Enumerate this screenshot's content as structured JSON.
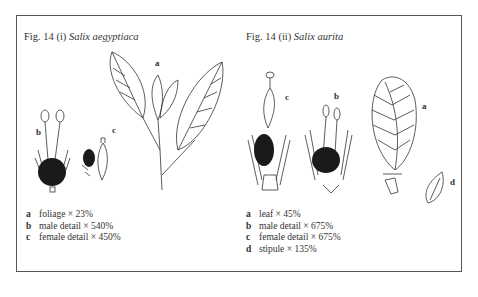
{
  "figures": [
    {
      "title_prefix": "Fig. 14 (i)",
      "species": "Salix aegyptiaca",
      "legend": [
        {
          "key": "a",
          "text": "foliage  × 23%"
        },
        {
          "key": "b",
          "text": "male detail  × 540%"
        },
        {
          "key": "c",
          "text": "female detail  × 450%"
        }
      ],
      "drawing_labels": {
        "a": "a",
        "b": "b",
        "c": "c"
      }
    },
    {
      "title_prefix": "Fig. 14 (ii)",
      "species": "Salix aurita",
      "legend": [
        {
          "key": "a",
          "text": "leaf  × 45%"
        },
        {
          "key": "b",
          "text": "male detail  × 675%"
        },
        {
          "key": "c",
          "text": "female detail  × 675%"
        },
        {
          "key": "d",
          "text": "stipule  × 135%"
        }
      ],
      "drawing_labels": {
        "a": "a",
        "b": "b",
        "c": "c",
        "d": "d"
      }
    }
  ]
}
